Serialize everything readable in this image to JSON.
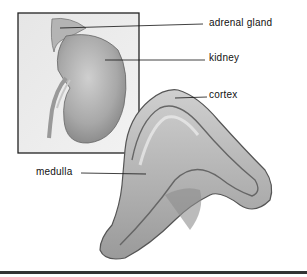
{
  "diagram": {
    "labels": {
      "adrenal_gland": "adrenal gland",
      "kidney": "kidney",
      "cortex": "cortex",
      "medulla": "medulla"
    },
    "colors": {
      "background": "#ffffff",
      "inset_border": "#222222",
      "leader_line": "#111111",
      "tissue_light": "#d9d9d9",
      "tissue_dark": "#8a8a8a"
    }
  }
}
